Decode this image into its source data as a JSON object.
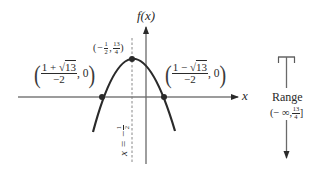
{
  "figure": {
    "type": "parabola-graph",
    "function": "f(x)",
    "axes": {
      "x_label": "x",
      "y_label": "f(x)"
    },
    "vertex": {
      "x_num_sign": "−",
      "x_num": "1",
      "x_den": "2",
      "y_num": "13",
      "y_den": "4",
      "label_open": "(",
      "label_sep": ",",
      "label_close": ")"
    },
    "left_root": {
      "numerator_prefix": "1 + ",
      "numerator_radical": "√",
      "numerator_radicand": "13",
      "denominator": "−2",
      "y": "0"
    },
    "right_root": {
      "numerator_prefix": "1 − ",
      "numerator_radical": "√",
      "numerator_radicand": "13",
      "denominator": "−2",
      "y": "0"
    },
    "axis_of_symmetry": {
      "lhs": "x",
      "eq": "=",
      "sign": "−",
      "num": "1",
      "den": "2"
    },
    "range": {
      "title": "Range",
      "open": "(",
      "lower": "− ∞",
      "sep": ",",
      "upper_num": "13",
      "upper_den": "4",
      "close": "]"
    },
    "colors": {
      "ink": "#2a2a2a",
      "axis": "#3a3a3a",
      "dashed": "#7a7a7a"
    }
  }
}
